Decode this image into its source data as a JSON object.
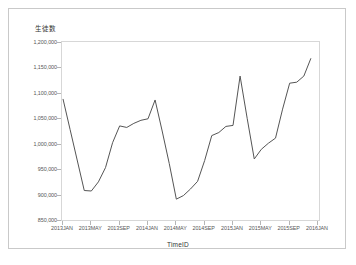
{
  "chart": {
    "ytitle": "生徒数",
    "xtitle": "TimeID"
  },
  "chart_data": {
    "type": "line",
    "title": "",
    "subtitle": "",
    "xlabel": "TimeID",
    "ylabel": "生徒数",
    "ylim": [
      850000,
      1200000
    ],
    "yticks": [
      850000,
      900000,
      950000,
      1000000,
      1050000,
      1100000,
      1150000,
      1200000
    ],
    "ytick_labels": [
      "850,000",
      "900,000",
      "950,000",
      "1,000,000",
      "1,050,000",
      "1,100,000",
      "1,150,000",
      "1,200,000"
    ],
    "xtick_labels": [
      "2013JAN",
      "2013MAY",
      "2013SEP",
      "2014JAN",
      "2014MAY",
      "2014SEP",
      "2015JAN",
      "2015MAY",
      "2015SEP",
      "2016JAN"
    ],
    "xtick_positions": [
      0,
      4,
      8,
      12,
      16,
      20,
      24,
      28,
      32,
      36
    ],
    "grid": false,
    "legend": false,
    "legend_position": "none",
    "line_color": "#555555",
    "series": [
      {
        "name": "生徒数",
        "x": [
          "2013JAN",
          "2013FEB",
          "2013MAR",
          "2013APR",
          "2013MAY",
          "2013JUN",
          "2013JUL",
          "2013AUG",
          "2013SEP",
          "2013OCT",
          "2013NOV",
          "2013DEC",
          "2014JAN",
          "2014FEB",
          "2014MAR",
          "2014APR",
          "2014MAY",
          "2014JUN",
          "2014JUL",
          "2014AUG",
          "2014SEP",
          "2014OCT",
          "2014NOV",
          "2014DEC",
          "2015JAN",
          "2015FEB",
          "2015MAR",
          "2015APR",
          "2015MAY",
          "2015JUN",
          "2015JUL",
          "2015AUG",
          "2015SEP",
          "2015OCT",
          "2015NOV",
          "2015DEC"
        ],
        "values": [
          1088000,
          1028000,
          968000,
          908000,
          907000,
          925000,
          953000,
          1002000,
          1035000,
          1032000,
          1040000,
          1046000,
          1049000,
          1086000,
          1025000,
          961000,
          891000,
          898000,
          911000,
          926000,
          967000,
          1016000,
          1022000,
          1034000,
          1036000,
          1133000,
          1050000,
          970000,
          989000,
          1001000,
          1011000,
          1068000,
          1119000,
          1121000,
          1133000,
          1168000
        ]
      }
    ]
  }
}
